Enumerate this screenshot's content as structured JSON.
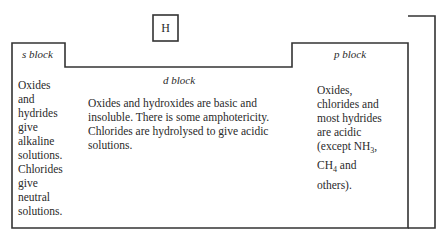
{
  "hydrogen": {
    "symbol": "H"
  },
  "s_block": {
    "label": "s block",
    "lines": [
      "Oxides",
      "and",
      "hydrides",
      "give",
      "alkaline",
      "solutions.",
      "Chlorides",
      "give",
      "neutral",
      "solutions."
    ]
  },
  "d_block": {
    "label": "d block",
    "lines": [
      "Oxides and hydroxides are basic and",
      "insoluble. There is some amphotericity.",
      "Chlorides are hydrolysed to give acidic",
      "solutions."
    ]
  },
  "p_block": {
    "label": "p block",
    "lines": [
      "Oxides,",
      "chlorides and",
      "most hydrides",
      "are acidic"
    ],
    "except_line": {
      "prefix": "(except NH",
      "sub": "3",
      "suffix": ","
    },
    "ch4_line": {
      "prefix": "CH",
      "sub": "4",
      "suffix": " and"
    },
    "last_line": "others)."
  }
}
